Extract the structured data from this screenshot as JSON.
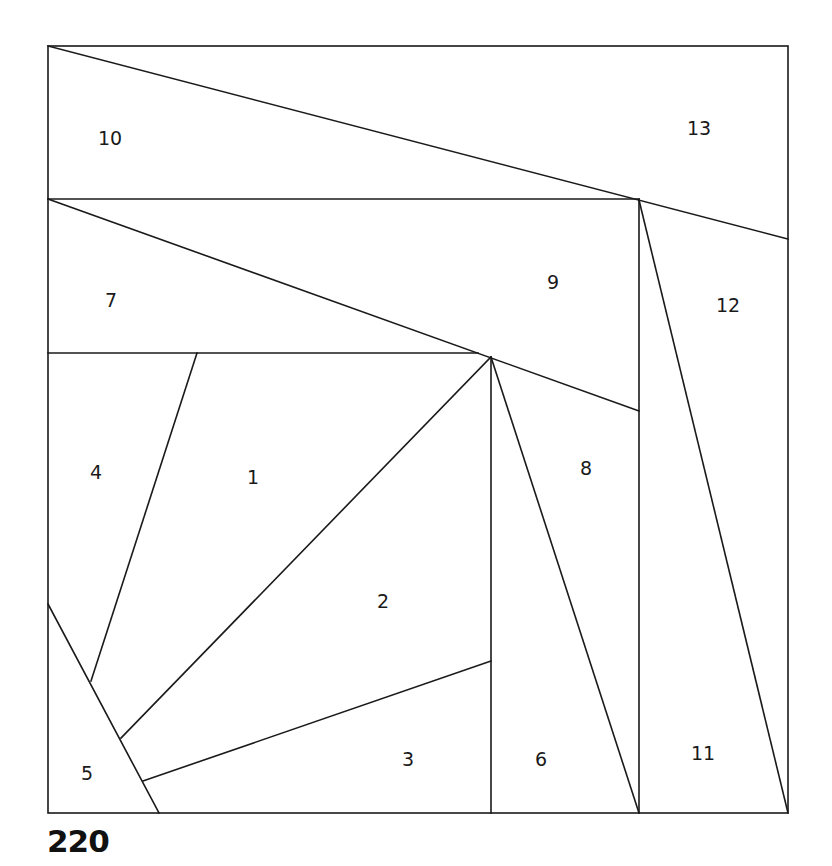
{
  "pattern_number": "220",
  "colors": {
    "line": "#1a1a1a",
    "background": "#ffffff"
  },
  "frame": {
    "x1": 48,
    "y1": 46,
    "x2": 788,
    "y2": 813
  },
  "segments": [
    {
      "id": "diag-10-13",
      "x1": 48,
      "y1": 46,
      "x2": 788,
      "y2": 239
    },
    {
      "id": "h-10-7",
      "x1": 48,
      "y1": 199,
      "x2": 639,
      "y2": 199
    },
    {
      "id": "v-9-12",
      "x1": 639,
      "y1": 199,
      "x2": 639,
      "y2": 813
    },
    {
      "id": "diag-12-11",
      "x1": 639,
      "y1": 200,
      "x2": 788,
      "y2": 813
    },
    {
      "id": "diag-7-9",
      "x1": 48,
      "y1": 199,
      "x2": 639,
      "y2": 411
    },
    {
      "id": "h-7-4",
      "x1": 48,
      "y1": 353,
      "x2": 478,
      "y2": 353
    },
    {
      "id": "v-2-6",
      "x1": 491,
      "y1": 357,
      "x2": 491,
      "y2": 813
    },
    {
      "id": "diag-8-6",
      "x1": 491,
      "y1": 357,
      "x2": 639,
      "y2": 813
    },
    {
      "id": "diag-1-2",
      "x1": 491,
      "y1": 357,
      "x2": 121,
      "y2": 738
    },
    {
      "id": "diag-4-1",
      "x1": 197,
      "y1": 353,
      "x2": 91,
      "y2": 681
    },
    {
      "id": "diag-4-5",
      "x1": 48,
      "y1": 604,
      "x2": 159,
      "y2": 813
    },
    {
      "id": "diag-2-3",
      "x1": 491,
      "y1": 661,
      "x2": 143,
      "y2": 781
    }
  ],
  "regions": [
    {
      "label": "10",
      "x": 110,
      "y": 138
    },
    {
      "label": "13",
      "x": 699,
      "y": 128
    },
    {
      "label": "7",
      "x": 111,
      "y": 300
    },
    {
      "label": "9",
      "x": 553,
      "y": 282
    },
    {
      "label": "12",
      "x": 728,
      "y": 305
    },
    {
      "label": "4",
      "x": 96,
      "y": 472
    },
    {
      "label": "1",
      "x": 253,
      "y": 477
    },
    {
      "label": "8",
      "x": 586,
      "y": 468
    },
    {
      "label": "2",
      "x": 383,
      "y": 601
    },
    {
      "label": "6",
      "x": 541,
      "y": 759
    },
    {
      "label": "11",
      "x": 703,
      "y": 753
    },
    {
      "label": "3",
      "x": 408,
      "y": 759
    },
    {
      "label": "5",
      "x": 87,
      "y": 773
    }
  ]
}
